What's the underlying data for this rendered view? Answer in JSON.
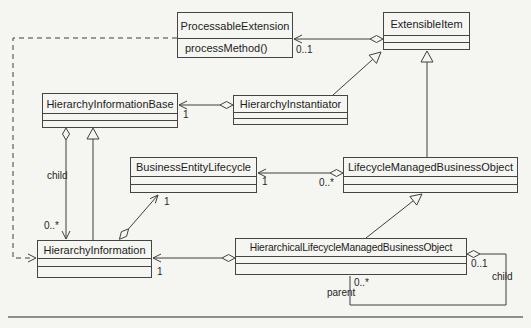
{
  "canvas": {
    "background_color": "#f5f5f1",
    "line_color": "#3f3f3f",
    "bottom_rule_color": "#8d8d8d"
  },
  "classes": {
    "processableExtension": {
      "name": "ProcessableExtension",
      "operation": "processMethod()"
    },
    "extensibleItem": {
      "name": "ExtensibleItem"
    },
    "hierarchyInformationBase": {
      "name": "HierarchyInformationBase"
    },
    "hierarchyInstantiator": {
      "name": "HierarchyInstantiator"
    },
    "businessEntityLifecycle": {
      "name": "BusinessEntityLifecycle"
    },
    "lifecycleManagedBusinessObject": {
      "name": "LifecycleManagedBusinessObject"
    },
    "hierarchyInformation": {
      "name": "HierarchyInformation"
    },
    "hierarchicalLifecycleManagedBusinessObject": {
      "name": "HierarchicalLifecycleManagedBusinessObject"
    }
  },
  "edge_labels": {
    "processable_mult": "0..1",
    "hib_end_mult": "1",
    "bel_end_mult": "1",
    "lmbo_end_mult": "0..*",
    "bel_agg_end_mult": "1",
    "child_left_role": "child",
    "child_left_mult": "0..*",
    "hi_end_mult": "1",
    "self_diamond_mult": "0..1",
    "child_right_role": "child",
    "parent_mult": "0..*",
    "parent_role": "parent"
  },
  "relationships": [
    {
      "type": "aggregation",
      "diamond_at": "ExtensibleItem",
      "arrow_at": "ProcessableExtension",
      "multiplicity": "0..1"
    },
    {
      "type": "dashed-dependency",
      "from": "ProcessableExtension",
      "arrow_at": "HierarchyInformation"
    },
    {
      "type": "aggregation",
      "diamond_at": "HierarchyInstantiator",
      "arrow_at": "HierarchyInformationBase",
      "multiplicity": "1"
    },
    {
      "type": "generalization",
      "from": "HierarchyInstantiator",
      "to": "ExtensibleItem"
    },
    {
      "type": "generalization",
      "from": "LifecycleManagedBusinessObject",
      "to": "ExtensibleItem"
    },
    {
      "type": "aggregation",
      "diamond_at": "LifecycleManagedBusinessObject",
      "arrow_at": "BusinessEntityLifecycle",
      "diamond_multiplicity": "0..*",
      "arrow_multiplicity": "1"
    },
    {
      "type": "aggregation",
      "diamond_at": "HierarchyInformation",
      "arrow_at": "BusinessEntityLifecycle",
      "arrow_multiplicity": "1"
    },
    {
      "type": "aggregation",
      "diamond_at": "HierarchyInformationBase",
      "arrow_at": "HierarchyInformation",
      "role": "child",
      "arrow_multiplicity": "0..*"
    },
    {
      "type": "generalization",
      "from": "HierarchyInformation",
      "to": "HierarchyInformationBase"
    },
    {
      "type": "generalization",
      "from": "HierarchicalLifecycleManagedBusinessObject",
      "to": "LifecycleManagedBusinessObject"
    },
    {
      "type": "aggregation",
      "diamond_at": "HierarchicalLifecycleManagedBusinessObject",
      "arrow_at": "HierarchyInformation",
      "arrow_multiplicity": "1"
    },
    {
      "type": "self-aggregation",
      "class": "HierarchicalLifecycleManagedBusinessObject",
      "diamond_multiplicity": "0..1",
      "child_role": "child",
      "parent_role": "parent",
      "parent_multiplicity": "0..*"
    }
  ]
}
